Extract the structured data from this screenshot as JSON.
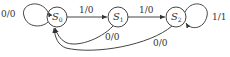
{
  "diagram": {
    "type": "finite-state-machine",
    "states": [
      {
        "id": "S0",
        "name": "S",
        "sub": "0"
      },
      {
        "id": "S1",
        "name": "S",
        "sub": "1"
      },
      {
        "id": "S2",
        "name": "S",
        "sub": "2"
      }
    ],
    "transitions": [
      {
        "from": "S0",
        "to": "S0",
        "label": "0/0"
      },
      {
        "from": "S0",
        "to": "S1",
        "label": "1/0"
      },
      {
        "from": "S1",
        "to": "S2",
        "label": "1/0"
      },
      {
        "from": "S2",
        "to": "S2",
        "label": "1/1"
      },
      {
        "from": "S1",
        "to": "S0",
        "label": "0/0"
      },
      {
        "from": "S2",
        "to": "S0",
        "label": "0/0"
      }
    ]
  }
}
